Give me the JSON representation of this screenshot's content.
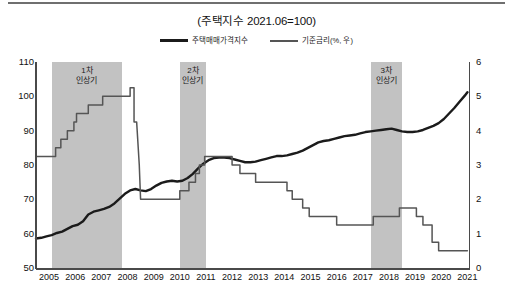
{
  "chart_title": "(주택지수 2021.06=100)",
  "legend": {
    "position": "top-center",
    "entries": [
      {
        "label": "주택매매가격지수",
        "style": "thick",
        "color": "#1b1b1b"
      },
      {
        "label": "기준금리(%, 우)",
        "style": "thin",
        "color": "#555555"
      }
    ]
  },
  "annotations": [
    {
      "name": "band-1",
      "label_line1": "1차",
      "label_line2": "인상기",
      "x_start": 2005.6,
      "x_end": 2008.3
    },
    {
      "name": "band-2",
      "label_line1": "2차",
      "label_line2": "인상기",
      "x_start": 2010.5,
      "x_end": 2011.5
    },
    {
      "name": "band-3",
      "label_line1": "3차",
      "label_line2": "인상기",
      "x_start": 2017.8,
      "x_end": 2019.0
    }
  ],
  "chart_data": {
    "type": "line",
    "title": "(주택지수 2021.06=100)",
    "xlabel": "",
    "ylabel": "",
    "y2label": "기준금리(%, 우)",
    "grid": false,
    "legend_position": "top-center",
    "xlim": [
      2005,
      2021.6
    ],
    "ylim": [
      50,
      110
    ],
    "y2lim": [
      0,
      6
    ],
    "yticks": [
      110,
      100,
      90,
      80,
      70,
      60,
      50
    ],
    "y2ticks": [
      6,
      5,
      4,
      3,
      2,
      1,
      0
    ],
    "xticks": [
      2005,
      2006,
      2007,
      2008,
      2009,
      2010,
      2011,
      2012,
      2013,
      2014,
      2015,
      2016,
      2017,
      2018,
      2019,
      2020,
      2021
    ],
    "shaded_bands": [
      {
        "label": "1차 인상기",
        "from": 2005.6,
        "to": 2008.3
      },
      {
        "label": "2차 인상기",
        "from": 2010.5,
        "to": 2011.5
      },
      {
        "label": "3차 인상기",
        "from": 2017.8,
        "to": 2019.0
      }
    ],
    "series": [
      {
        "name": "주택매매가격지수",
        "axis": "left",
        "color": "#1b1b1b",
        "width": 2.4,
        "points": [
          [
            2005.0,
            58.6
          ],
          [
            2005.2,
            58.8
          ],
          [
            2005.4,
            59.2
          ],
          [
            2005.6,
            59.6
          ],
          [
            2005.8,
            60.2
          ],
          [
            2006.0,
            60.6
          ],
          [
            2006.2,
            61.4
          ],
          [
            2006.4,
            62.2
          ],
          [
            2006.6,
            62.6
          ],
          [
            2006.8,
            63.6
          ],
          [
            2007.0,
            65.6
          ],
          [
            2007.2,
            66.4
          ],
          [
            2007.4,
            66.8
          ],
          [
            2007.6,
            67.2
          ],
          [
            2007.8,
            67.8
          ],
          [
            2008.0,
            68.8
          ],
          [
            2008.2,
            70.2
          ],
          [
            2008.4,
            71.6
          ],
          [
            2008.6,
            72.6
          ],
          [
            2008.8,
            73.0
          ],
          [
            2009.0,
            72.6
          ],
          [
            2009.2,
            72.4
          ],
          [
            2009.4,
            73.0
          ],
          [
            2009.6,
            74.0
          ],
          [
            2009.8,
            74.8
          ],
          [
            2010.0,
            75.2
          ],
          [
            2010.2,
            75.4
          ],
          [
            2010.4,
            75.2
          ],
          [
            2010.6,
            75.4
          ],
          [
            2010.8,
            76.2
          ],
          [
            2011.0,
            77.4
          ],
          [
            2011.2,
            79.0
          ],
          [
            2011.4,
            80.4
          ],
          [
            2011.6,
            81.4
          ],
          [
            2011.8,
            82.0
          ],
          [
            2012.0,
            82.2
          ],
          [
            2012.2,
            82.2
          ],
          [
            2012.4,
            82.0
          ],
          [
            2012.6,
            81.6
          ],
          [
            2012.8,
            81.2
          ],
          [
            2013.0,
            80.8
          ],
          [
            2013.2,
            80.8
          ],
          [
            2013.4,
            81.0
          ],
          [
            2013.6,
            81.4
          ],
          [
            2013.8,
            81.8
          ],
          [
            2014.0,
            82.2
          ],
          [
            2014.2,
            82.6
          ],
          [
            2014.4,
            82.6
          ],
          [
            2014.6,
            82.8
          ],
          [
            2014.8,
            83.2
          ],
          [
            2015.0,
            83.6
          ],
          [
            2015.2,
            84.2
          ],
          [
            2015.4,
            85.0
          ],
          [
            2015.6,
            85.8
          ],
          [
            2015.8,
            86.6
          ],
          [
            2016.0,
            87.0
          ],
          [
            2016.2,
            87.2
          ],
          [
            2016.4,
            87.6
          ],
          [
            2016.6,
            88.0
          ],
          [
            2016.8,
            88.4
          ],
          [
            2017.0,
            88.6
          ],
          [
            2017.2,
            88.8
          ],
          [
            2017.4,
            89.2
          ],
          [
            2017.6,
            89.6
          ],
          [
            2017.8,
            89.8
          ],
          [
            2018.0,
            90.0
          ],
          [
            2018.2,
            90.2
          ],
          [
            2018.4,
            90.4
          ],
          [
            2018.6,
            90.6
          ],
          [
            2018.8,
            90.2
          ],
          [
            2019.0,
            89.8
          ],
          [
            2019.2,
            89.6
          ],
          [
            2019.4,
            89.6
          ],
          [
            2019.6,
            89.8
          ],
          [
            2019.8,
            90.2
          ],
          [
            2020.0,
            90.8
          ],
          [
            2020.2,
            91.4
          ],
          [
            2020.4,
            92.2
          ],
          [
            2020.6,
            93.4
          ],
          [
            2020.8,
            95.0
          ],
          [
            2021.0,
            96.6
          ],
          [
            2021.2,
            98.4
          ],
          [
            2021.4,
            100.2
          ],
          [
            2021.5,
            101.2
          ]
        ]
      },
      {
        "name": "기준금리(%, 우)",
        "axis": "right",
        "color": "#555555",
        "width": 1.5,
        "step": true,
        "points": [
          [
            2005.0,
            3.25
          ],
          [
            2005.75,
            3.25
          ],
          [
            2005.75,
            3.5
          ],
          [
            2005.95,
            3.5
          ],
          [
            2005.95,
            3.75
          ],
          [
            2006.2,
            3.75
          ],
          [
            2006.2,
            4.0
          ],
          [
            2006.45,
            4.0
          ],
          [
            2006.45,
            4.25
          ],
          [
            2006.55,
            4.25
          ],
          [
            2006.55,
            4.5
          ],
          [
            2007.0,
            4.5
          ],
          [
            2007.0,
            4.75
          ],
          [
            2007.55,
            4.75
          ],
          [
            2007.55,
            5.0
          ],
          [
            2008.6,
            5.0
          ],
          [
            2008.6,
            5.25
          ],
          [
            2008.75,
            5.25
          ],
          [
            2008.75,
            4.25
          ],
          [
            2008.85,
            4.25
          ],
          [
            2008.95,
            3.0
          ],
          [
            2009.0,
            2.0
          ],
          [
            2009.1,
            2.0
          ],
          [
            2010.5,
            2.0
          ],
          [
            2010.5,
            2.25
          ],
          [
            2010.85,
            2.25
          ],
          [
            2010.85,
            2.5
          ],
          [
            2011.1,
            2.5
          ],
          [
            2011.1,
            2.75
          ],
          [
            2011.25,
            2.75
          ],
          [
            2011.25,
            3.0
          ],
          [
            2011.45,
            3.0
          ],
          [
            2011.45,
            3.25
          ],
          [
            2012.5,
            3.25
          ],
          [
            2012.5,
            3.0
          ],
          [
            2012.8,
            3.0
          ],
          [
            2012.8,
            2.75
          ],
          [
            2013.4,
            2.75
          ],
          [
            2013.4,
            2.5
          ],
          [
            2014.6,
            2.5
          ],
          [
            2014.6,
            2.25
          ],
          [
            2014.8,
            2.25
          ],
          [
            2014.8,
            2.0
          ],
          [
            2015.2,
            2.0
          ],
          [
            2015.2,
            1.75
          ],
          [
            2015.45,
            1.75
          ],
          [
            2015.45,
            1.5
          ],
          [
            2016.5,
            1.5
          ],
          [
            2016.5,
            1.25
          ],
          [
            2017.9,
            1.25
          ],
          [
            2017.9,
            1.5
          ],
          [
            2018.9,
            1.5
          ],
          [
            2018.9,
            1.75
          ],
          [
            2019.55,
            1.75
          ],
          [
            2019.55,
            1.5
          ],
          [
            2019.8,
            1.5
          ],
          [
            2019.8,
            1.25
          ],
          [
            2020.15,
            1.25
          ],
          [
            2020.15,
            0.75
          ],
          [
            2020.4,
            0.75
          ],
          [
            2020.4,
            0.5
          ],
          [
            2021.5,
            0.5
          ]
        ]
      }
    ]
  }
}
